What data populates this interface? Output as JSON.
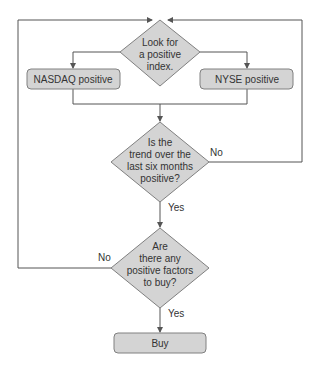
{
  "colors": {
    "line": "#555555",
    "node_fill": "#d4d4d4",
    "node_stroke": "#808080",
    "text": "#333333",
    "background": "#ffffff"
  },
  "nodes": {
    "start": {
      "lines": [
        "Look for",
        "a positive",
        "index."
      ]
    },
    "nasdaq": {
      "label": "NASDAQ positive"
    },
    "nyse": {
      "label": "NYSE positive"
    },
    "trend": {
      "lines": [
        "Is the",
        "trend over the",
        "last six months",
        "positive?"
      ]
    },
    "factors": {
      "lines": [
        "Are",
        "there any",
        "positive factors",
        "to buy?"
      ]
    },
    "buy": {
      "label": "Buy"
    }
  },
  "edges": {
    "trend_no": "No",
    "trend_yes": "Yes",
    "factors_no": "No",
    "factors_yes": "Yes"
  }
}
